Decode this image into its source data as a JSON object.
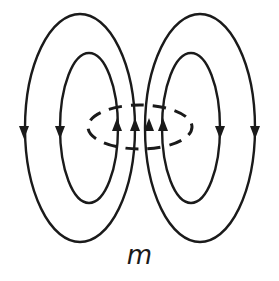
{
  "diagram": {
    "label": "m",
    "stroke_color": "#1a1a1a",
    "background": "#ffffff",
    "elements": [
      {
        "name": "outer-left-field-loop",
        "direction": "down on outside, up through center"
      },
      {
        "name": "inner-left-field-loop",
        "direction": "down on outside, up through center"
      },
      {
        "name": "inner-right-field-loop",
        "direction": "down on outside, up through center"
      },
      {
        "name": "outer-right-field-loop",
        "direction": "down on outside, up through center"
      },
      {
        "name": "current-loop-dashed-ellipse",
        "style": "dashed"
      }
    ],
    "arrows": {
      "down": 4,
      "up": 4
    }
  }
}
